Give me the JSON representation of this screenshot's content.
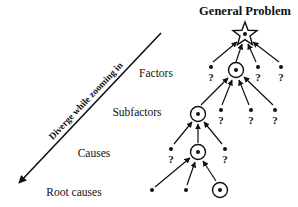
{
  "title": "General Problem",
  "axis": {
    "label": "Diverge while zooming in",
    "direction": "down-left"
  },
  "levels": [
    {
      "label": "Factors"
    },
    {
      "label": "Subfactors"
    },
    {
      "label": "Causes"
    },
    {
      "label": "Root causes"
    }
  ],
  "unknown_marker": "?",
  "nodes": {
    "root": {
      "type": "star",
      "x": 245,
      "y": 34
    },
    "factors": [
      {
        "type": "unknown",
        "x": 211,
        "y": 70
      },
      {
        "type": "selected",
        "x": 236,
        "y": 70
      },
      {
        "type": "unknown",
        "x": 258,
        "y": 70
      },
      {
        "type": "unknown",
        "x": 281,
        "y": 70
      }
    ],
    "subfactors": [
      {
        "type": "selected",
        "x": 198,
        "y": 114
      },
      {
        "type": "unknown",
        "x": 221,
        "y": 114
      },
      {
        "type": "unknown",
        "x": 251,
        "y": 114
      },
      {
        "type": "unknown",
        "x": 275,
        "y": 114
      }
    ],
    "causes": [
      {
        "type": "unknown",
        "x": 171,
        "y": 152
      },
      {
        "type": "selected",
        "x": 198,
        "y": 152
      },
      {
        "type": "unknown",
        "x": 225,
        "y": 152
      }
    ],
    "root_causes": [
      {
        "type": "dot",
        "x": 152,
        "y": 190
      },
      {
        "type": "dot",
        "x": 186,
        "y": 190
      },
      {
        "type": "selected",
        "x": 220,
        "y": 190
      }
    ]
  },
  "colors": {
    "ink": "#111111",
    "background": "#ffffff"
  }
}
